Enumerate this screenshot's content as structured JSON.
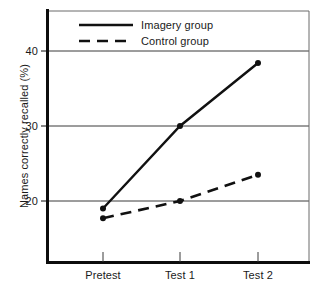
{
  "chart_data": {
    "type": "line",
    "title": "",
    "xlabel": "",
    "ylabel": "Names correctly recalled (%)",
    "categories": [
      "Pretest",
      "Test 1",
      "Test 2"
    ],
    "series": [
      {
        "name": "Imagery group",
        "style": "solid",
        "color": "#111111",
        "values": [
          19.0,
          30.0,
          38.4
        ]
      },
      {
        "name": "Control group",
        "style": "dashed",
        "color": "#111111",
        "values": [
          17.7,
          20.0,
          23.5
        ]
      }
    ],
    "yticks": [
      20,
      30,
      40
    ],
    "ytick_labels": [
      "20",
      "30",
      "40"
    ],
    "ylim": [
      13.1,
      46.7
    ],
    "grid": "horizontal",
    "legend_position": "inside-top-left",
    "markers": "filled-circle"
  },
  "axes": {
    "y_title": "Names correctly recalled (%)",
    "y_tick_0": "20",
    "y_tick_1": "30",
    "y_tick_2": "40",
    "x_tick_0": "Pretest",
    "x_tick_1": "Test 1",
    "x_tick_2": "Test 2"
  },
  "legend": {
    "entry_0_label": "Imagery group",
    "entry_1_label": "Control group"
  }
}
